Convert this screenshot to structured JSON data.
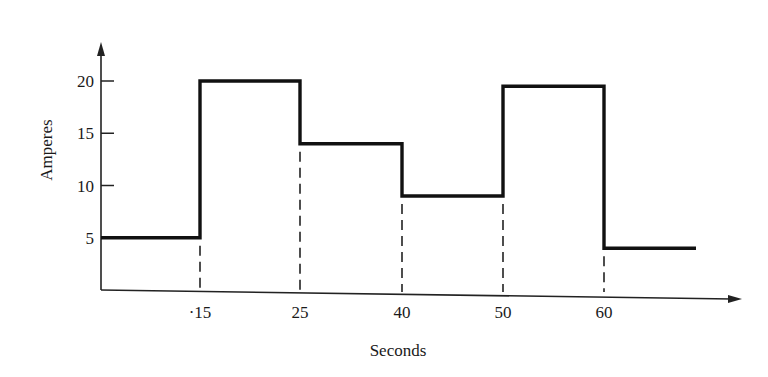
{
  "chart_data": {
    "type": "line",
    "subtype": "step",
    "title": "",
    "xlabel": "Seconds",
    "ylabel": "Amperes",
    "x_ticks": [
      15,
      25,
      40,
      50,
      60
    ],
    "x_tick_labels": [
      "·15",
      "25",
      "40",
      "50",
      "60"
    ],
    "y_ticks": [
      5,
      10,
      15,
      20
    ],
    "y_tick_labels": [
      "5",
      "10",
      "15",
      "20"
    ],
    "ylim": [
      0,
      22
    ],
    "grid": false,
    "legend": null,
    "series": [
      {
        "name": "Current",
        "segments": [
          {
            "x_start": 0,
            "x_end": 15,
            "value": 5
          },
          {
            "x_start": 15,
            "x_end": 25,
            "value": 20
          },
          {
            "x_start": 25,
            "x_end": 40,
            "value": 14
          },
          {
            "x_start": 40,
            "x_end": 50,
            "value": 9
          },
          {
            "x_start": 50,
            "x_end": 60,
            "value": 19.5
          },
          {
            "x_start": 60,
            "x_end": 69,
            "value": 4
          }
        ]
      }
    ],
    "annotations": "Dashed vertical lines drop from each step transition (15, 25, 40, 50, 60) to the x-axis"
  },
  "colors": {
    "line": "#111111",
    "axis": "#222222",
    "background": "#ffffff"
  }
}
